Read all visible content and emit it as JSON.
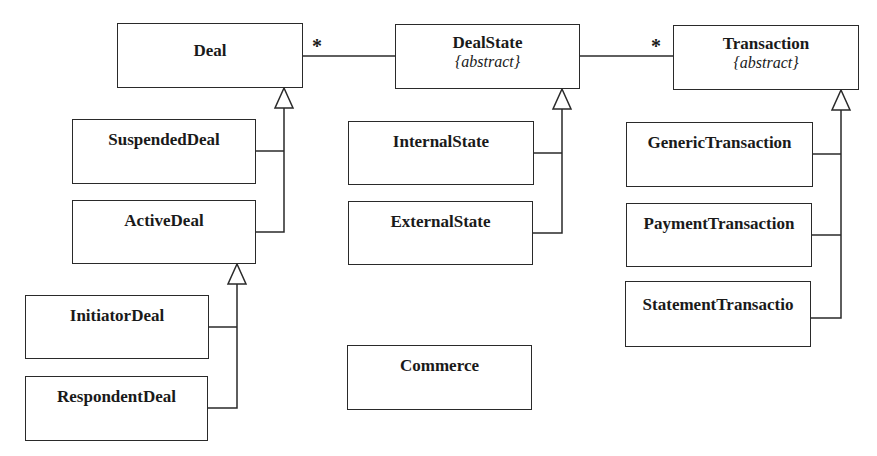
{
  "diagram": {
    "type": "UML class diagram",
    "classes": {
      "deal": {
        "name": "Deal",
        "stereotype": ""
      },
      "deal_state": {
        "name": "DealState",
        "stereotype": "{abstract}"
      },
      "transaction": {
        "name": "Transaction",
        "stereotype": "{abstract}"
      },
      "suspended_deal": {
        "name": "SuspendedDeal"
      },
      "active_deal": {
        "name": "ActiveDeal"
      },
      "initiator_deal": {
        "name": "InitiatorDeal"
      },
      "respondent_deal": {
        "name": "RespondentDeal"
      },
      "internal_state": {
        "name": "InternalState"
      },
      "external_state": {
        "name": "ExternalState"
      },
      "generic_transaction": {
        "name": "GenericTransaction"
      },
      "payment_transaction": {
        "name": "PaymentTransaction"
      },
      "statement_transaction": {
        "name": "StatementTransactio"
      },
      "commerce": {
        "name": "Commerce"
      }
    },
    "associations": [
      {
        "from": "Deal",
        "to": "DealState",
        "multiplicity_near_from": "*"
      },
      {
        "from": "DealState",
        "to": "Transaction",
        "multiplicity_near_to": "*"
      }
    ],
    "generalizations": [
      {
        "parent": "Deal",
        "children": [
          "SuspendedDeal",
          "ActiveDeal"
        ]
      },
      {
        "parent": "ActiveDeal",
        "children": [
          "InitiatorDeal",
          "RespondentDeal"
        ]
      },
      {
        "parent": "DealState",
        "children": [
          "InternalState",
          "ExternalState"
        ]
      },
      {
        "parent": "Transaction",
        "children": [
          "GenericTransaction",
          "PaymentTransaction",
          "StatementTransactio"
        ]
      }
    ],
    "multiplicities": {
      "deal_dealstate": "*",
      "dealstate_transaction": "*"
    }
  }
}
